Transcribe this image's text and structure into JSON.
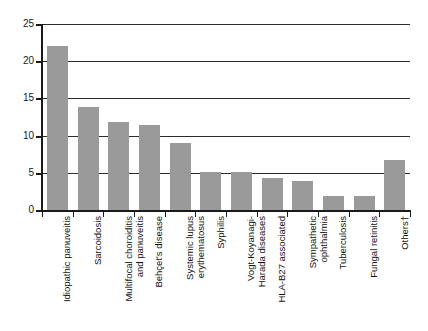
{
  "chart_data": {
    "type": "bar",
    "title": "",
    "xlabel": "",
    "ylabel": "",
    "ylim": [
      0,
      25
    ],
    "yticks": [
      0,
      5,
      10,
      15,
      20,
      25
    ],
    "ytick_labels": [
      "0",
      "5",
      "10",
      "15",
      "20",
      "25"
    ],
    "grid": "horizontal",
    "legend": "none",
    "bar_color": "#9a9a9a",
    "axis_color": "#1a1a1a",
    "orientation": "vertical",
    "categories": [
      "Idiopathic panuveitis",
      "Sarcoidosis",
      "Multifocal choroiditis\nand panuveitis",
      "Behçet's disease",
      "Systemic lupus\nerythematosus",
      "Syphilis",
      "Vogt-Koyanagi-\nHarada diseases",
      "HLA-B27 associated",
      "Sympathetic\nophthalmia",
      "Tuberculosis",
      "Fungal retinitis",
      "Others†"
    ],
    "values": [
      22.2,
      14.0,
      11.9,
      11.5,
      9.1,
      5.2,
      5.3,
      4.4,
      4.1,
      2.0,
      2.0,
      6.8
    ]
  }
}
